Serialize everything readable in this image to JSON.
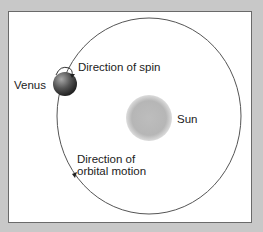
{
  "diagram": {
    "labels": {
      "venus": "Venus",
      "sun": "Sun",
      "spin": "Direction of spin",
      "orbital_line1": "Direction of",
      "orbital_line2": "orbital motion"
    },
    "colors": {
      "background": "#c8c8c8",
      "panel": "#ffffff",
      "orbit": "#555555",
      "sun": "#b8b8b8",
      "venus_light": "#9a9a9a",
      "venus_dark": "#2e2e2e"
    }
  }
}
